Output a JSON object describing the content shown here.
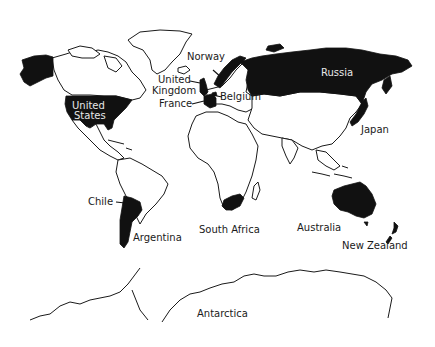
{
  "map": {
    "type": "world-map",
    "highlight_color": "#111111",
    "land_fill": "#ffffff",
    "outline_color": "#1a1a1a",
    "highlighted_countries": [
      "United States",
      "United Kingdom",
      "France",
      "Belgium",
      "Norway",
      "Russia",
      "Japan",
      "Chile",
      "Argentina",
      "South Africa",
      "Australia",
      "New Zealand"
    ],
    "labels": {
      "norway": "Norway",
      "united_kingdom_1": "United",
      "united_kingdom_2": "Kingdom",
      "france": "France",
      "belgium": "Belgium",
      "russia": "Russia",
      "united_states_1": "United",
      "united_states_2": "States",
      "japan": "Japan",
      "chile": "Chile",
      "argentina": "Argentina",
      "south_africa": "South Africa",
      "australia": "Australia",
      "new_zealand": "New Zealand",
      "antarctica": "Antarctica"
    }
  }
}
